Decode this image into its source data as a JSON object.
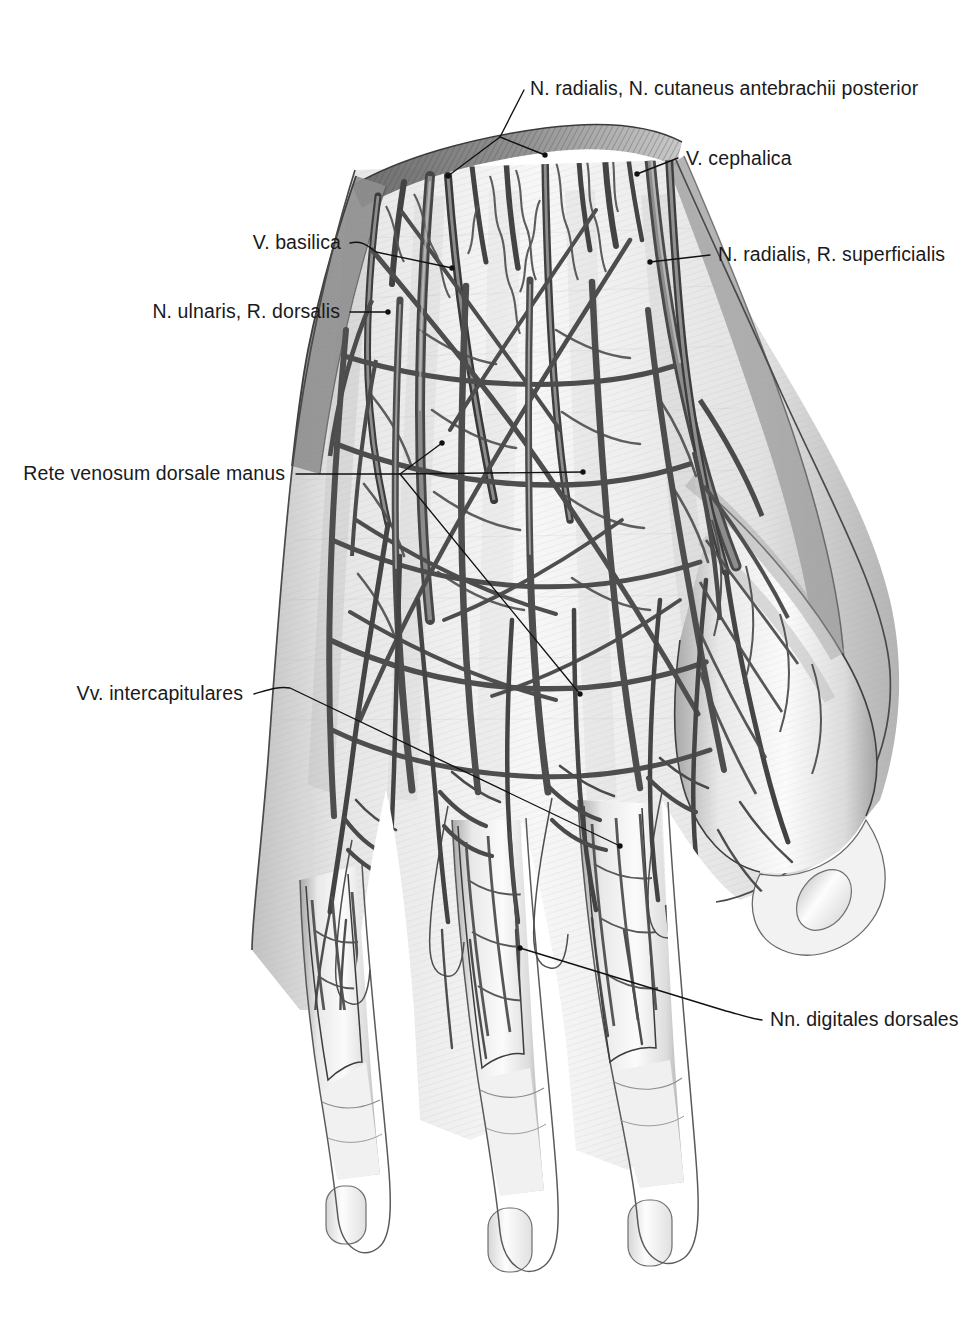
{
  "plate": {
    "title": "Dorsum of the hand — superficial veins and nerves",
    "view": "Dorsal view, right hand, superficial dissection",
    "background_color": "#ffffff",
    "ink_color": "#111111",
    "width": 978,
    "height": 1328
  },
  "labels": [
    {
      "id": "n-radialis-cutaneus-antebrachii-posterior",
      "text": "N. radialis, N. cutaneus antebrachii posterior",
      "align": "start",
      "text_x": 530,
      "text_y": 95,
      "leader_kind": "forked",
      "leader_path": "M 524 90 L 500 137 L 545 155",
      "fork_paths": [
        "M 500 137 L 448 176",
        "M 500 137 L 545 155"
      ],
      "dots": [
        [
          448,
          176
        ],
        [
          545,
          155
        ]
      ]
    },
    {
      "id": "v-cephalica",
      "text": "V. cephalica",
      "align": "start",
      "text_x": 686,
      "text_y": 165,
      "leader_kind": "straight",
      "leader_path": "M 678 158 L 637 174",
      "dots": [
        [
          637,
          174
        ]
      ]
    },
    {
      "id": "v-basilica",
      "text": "V. basilica",
      "align": "end",
      "text_x": 341,
      "text_y": 249,
      "leader_kind": "straight",
      "leader_path": "M 350 243 L 373 251 L 452 268",
      "dots": [
        [
          452,
          268
        ]
      ]
    },
    {
      "id": "n-radialis-r-superficialis",
      "text": "N. radialis, R. superficialis",
      "align": "start",
      "text_x": 718,
      "text_y": 261,
      "leader_kind": "straight",
      "leader_path": "M 710 255 L 650 262",
      "dots": [
        [
          650,
          262
        ]
      ]
    },
    {
      "id": "n-ulnaris-r-dorsalis",
      "text": "N. ulnaris, R. dorsalis",
      "align": "end",
      "text_x": 340,
      "text_y": 318,
      "leader_kind": "straight",
      "leader_path": "M 350 312 L 388 312",
      "dots": [
        [
          388,
          312
        ]
      ]
    },
    {
      "id": "rete-venosum-dorsale-manus",
      "text": "Rete venosum dorsale manus",
      "align": "end",
      "text_x": 285,
      "text_y": 480,
      "leader_kind": "branched",
      "leader_path": "M 296 474 L 400 474",
      "fork_paths": [
        "M 400 474 L 442 443",
        "M 400 474 L 583 472",
        "M 400 474 L 580 694"
      ],
      "dots": [
        [
          442,
          443
        ],
        [
          583,
          472
        ],
        [
          580,
          694
        ]
      ]
    },
    {
      "id": "vv-intercapitulares",
      "text": "Vv. intercapitulares",
      "align": "end",
      "text_x": 243,
      "text_y": 700,
      "leader_kind": "straight",
      "leader_path": "M 254 694 L 290 688 L 620 846",
      "dots": [
        [
          620,
          846
        ]
      ]
    },
    {
      "id": "nn-digitales-dorsales",
      "text": "Nn. digitales dorsales",
      "align": "start",
      "text_x": 770,
      "text_y": 1026,
      "leader_kind": "straight",
      "leader_path": "M 762 1020 L 726 1011 L 520 948",
      "dots": [
        [
          520,
          948
        ]
      ]
    }
  ],
  "anatomy": {
    "structures": [
      "cut skin edge of forearm",
      "rete venosum dorsale manus",
      "vena cephalica",
      "vena basilica",
      "nervus radialis ramus superficialis",
      "nervus ulnaris ramus dorsalis",
      "nervi digitales dorsales",
      "venae intercapitulares",
      "fingernails (unguis)",
      "skin flaps reflected over digits"
    ],
    "digits": [
      "thumb-side index finger",
      "middle finger",
      "ring finger",
      "little finger"
    ]
  }
}
